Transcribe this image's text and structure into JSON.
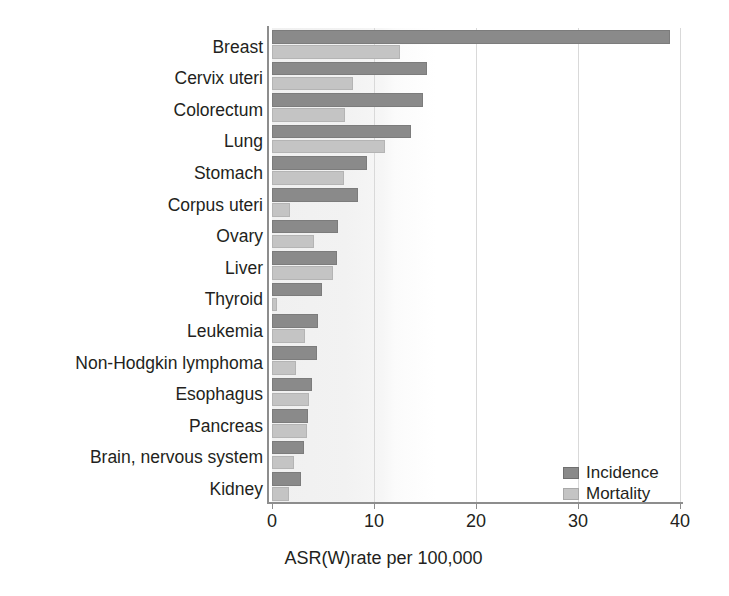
{
  "chart_data": {
    "type": "bar",
    "orientation": "horizontal",
    "title": "",
    "xlabel": "ASR(W)rate per 100,000",
    "ylabel": "",
    "xlim": [
      0,
      40
    ],
    "xticks": [
      0,
      10,
      20,
      30,
      40
    ],
    "xtick_labels": [
      "0",
      "10",
      "20",
      "30",
      "40"
    ],
    "grid": true,
    "grid_axis": "x",
    "legend_position": "bottom-right",
    "categories": [
      "Breast",
      "Cervix uteri",
      "Colorectum",
      "Lung",
      "Stomach",
      "Corpus uteri",
      "Ovary",
      "Liver",
      "Thyroid",
      "Leukemia",
      "Non-Hodgkin lymphoma",
      "Esophagus",
      "Pancreas",
      "Brain, nervous system",
      "Kidney"
    ],
    "series": [
      {
        "name": "Incidence",
        "color": "#8a8a8a",
        "values": [
          38.9,
          15.2,
          14.8,
          13.6,
          9.3,
          8.4,
          6.5,
          6.4,
          4.9,
          4.5,
          4.4,
          3.9,
          3.5,
          3.1,
          2.8
        ]
      },
      {
        "name": "Mortality",
        "color": "#c4c4c4",
        "values": [
          12.5,
          7.9,
          7.1,
          11.1,
          7.0,
          1.8,
          4.1,
          6.0,
          0.5,
          3.2,
          2.3,
          3.6,
          3.4,
          2.2,
          1.7
        ]
      }
    ]
  },
  "legend": {
    "items": [
      {
        "label": "Incidence",
        "color": "#8a8a8a"
      },
      {
        "label": "Mortality",
        "color": "#c4c4c4"
      }
    ]
  },
  "axes": {
    "x_title": "ASR(W)rate per 100,000",
    "x_tick_labels": [
      "0",
      "10",
      "20",
      "30",
      "40"
    ]
  }
}
